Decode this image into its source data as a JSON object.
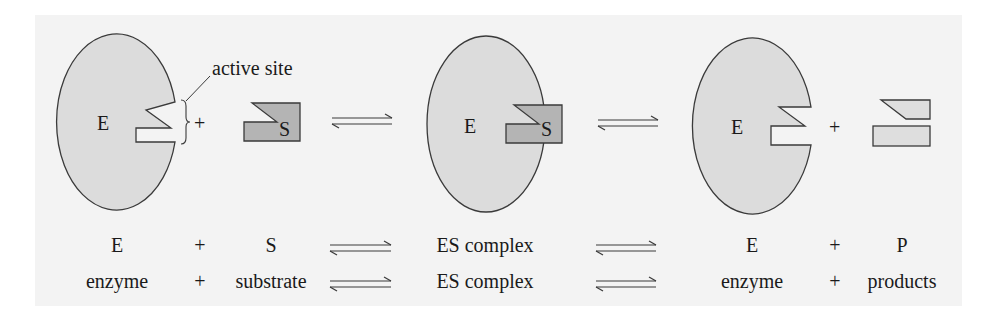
{
  "colors": {
    "panel_bg": "#f3f3f3",
    "enzyme_fill": "#dcdcdc",
    "substrate_fill": "#b4b4b4",
    "product_fill": "#dedede",
    "stroke": "#3a3a3a"
  },
  "diagram": {
    "enzyme_label": "E",
    "substrate_label": "S",
    "active_site_label": "active site",
    "plus": "+"
  },
  "equations": {
    "symbolic": {
      "reactant1": "E",
      "plus1": "+",
      "reactant2": "S",
      "intermediate": "ES complex",
      "product1": "E",
      "plus2": "+",
      "product2": "P"
    },
    "verbal": {
      "reactant1": "enzyme",
      "plus1": "+",
      "reactant2": "substrate",
      "intermediate": "ES complex",
      "product1": "enzyme",
      "plus2": "+",
      "product2": "products"
    }
  }
}
